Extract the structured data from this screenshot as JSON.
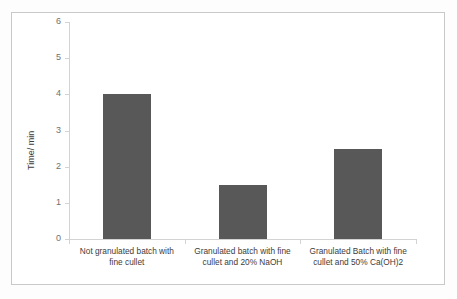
{
  "chart_data": {
    "type": "bar",
    "title": "",
    "xlabel": "",
    "ylabel": "Time/ min",
    "ylim": [
      0,
      6
    ],
    "ytick_labels": [
      "0",
      "1",
      "2",
      "3",
      "4",
      "5",
      "6"
    ],
    "ytick_values": [
      0,
      1,
      2,
      3,
      4,
      5,
      6
    ],
    "grid": false,
    "legend": false,
    "bar_color": "#585858",
    "axis_color": "#d3d3d3",
    "frame_color": "#c9c9c9",
    "categories": [
      "Not granulated batch with fine cullet",
      "Granulated batch with fine cullet and 20% NaOH",
      "Granulated Batch with fine cullet and  50% Ca(OH)2"
    ],
    "category_lines": [
      [
        "Not granulated batch with",
        "fine cullet"
      ],
      [
        "Granulated batch with fine",
        "cullet and 20% NaOH"
      ],
      [
        "Granulated Batch with fine",
        "cullet and  50% Ca(OH)2"
      ]
    ],
    "values": [
      4,
      1.5,
      2.5
    ]
  }
}
